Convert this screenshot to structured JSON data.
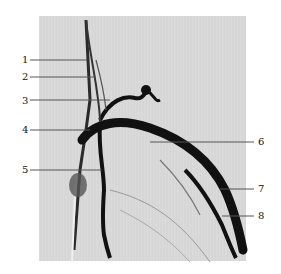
{
  "figure": {
    "type": "angiogram-illustration",
    "background": "#ffffff",
    "panel_color": "#d8d8d8",
    "vessel_color": "#111111",
    "leader_color": "#555555",
    "labels": [
      {
        "id": "1",
        "text": "1",
        "x": 22,
        "y": 56,
        "tip_x": 87,
        "tip_y": 60
      },
      {
        "id": "2",
        "text": "2",
        "x": 22,
        "y": 73,
        "tip_x": 96,
        "tip_y": 77
      },
      {
        "id": "3",
        "text": "3",
        "x": 22,
        "y": 97,
        "tip_x": 110,
        "tip_y": 100
      },
      {
        "id": "4",
        "text": "4",
        "x": 22,
        "y": 126,
        "tip_x": 90,
        "tip_y": 130
      },
      {
        "id": "5",
        "text": "5",
        "x": 22,
        "y": 166,
        "tip_x": 102,
        "tip_y": 170
      },
      {
        "id": "6",
        "text": "6",
        "x": 258,
        "y": 138,
        "tip_x": 150,
        "tip_y": 142
      },
      {
        "id": "7",
        "text": "7",
        "x": 258,
        "y": 185,
        "tip_x": 220,
        "tip_y": 189
      },
      {
        "id": "8",
        "text": "8",
        "x": 258,
        "y": 212,
        "tip_x": 222,
        "tip_y": 216
      }
    ]
  }
}
